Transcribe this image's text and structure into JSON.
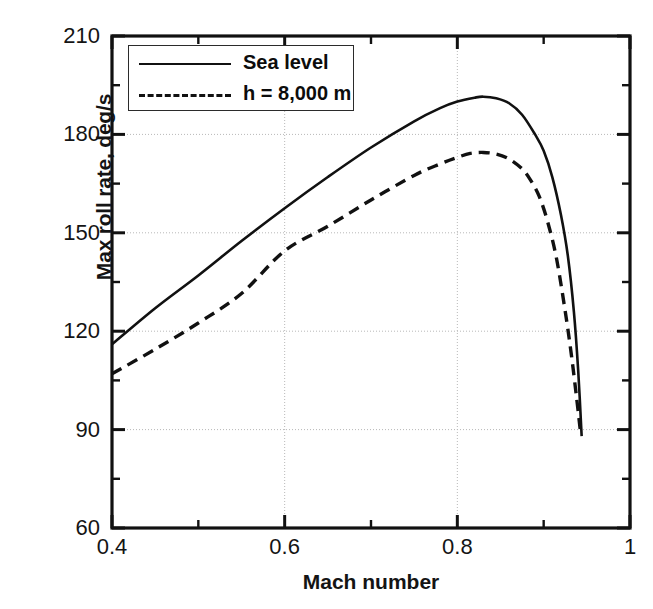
{
  "chart_data": {
    "type": "line",
    "title": "",
    "xlabel": "Mach number",
    "ylabel": "Max roll rate, deg/s",
    "xlim": [
      0.4,
      1.0
    ],
    "ylim": [
      60,
      210
    ],
    "xticks": [
      "0.4",
      "0.6",
      "0.8",
      "1"
    ],
    "xtick_values": [
      0.4,
      0.6,
      0.8,
      1.0
    ],
    "xminor_ticks": [
      0.5,
      0.7,
      0.9
    ],
    "yticks": [
      "60",
      "90",
      "120",
      "150",
      "180",
      "210"
    ],
    "ytick_values": [
      60,
      90,
      120,
      150,
      180,
      210
    ],
    "yminor_ticks": [
      75,
      105,
      135,
      165,
      195
    ],
    "grid": true,
    "grid_style": "dotted",
    "legend_position": "upper-left",
    "line_color": "#111111",
    "series": [
      {
        "name": "Sea level",
        "style": "solid",
        "x": [
          0.4,
          0.45,
          0.5,
          0.55,
          0.6,
          0.65,
          0.7,
          0.75,
          0.78,
          0.8,
          0.82,
          0.83,
          0.845,
          0.86,
          0.875,
          0.89,
          0.9,
          0.91,
          0.92,
          0.928,
          0.935,
          0.94,
          0.944
        ],
        "y": [
          116.0,
          127.0,
          137.0,
          147.5,
          157.5,
          167.0,
          176.0,
          184.0,
          188.0,
          190.0,
          191.2,
          191.5,
          191.0,
          189.5,
          186.0,
          180.0,
          175.0,
          167.0,
          155.5,
          143.0,
          126.0,
          108.0,
          88.0
        ]
      },
      {
        "name": "h = 8,000 m",
        "style": "dashed",
        "x": [
          0.4,
          0.45,
          0.5,
          0.55,
          0.6,
          0.65,
          0.7,
          0.75,
          0.78,
          0.8,
          0.815,
          0.83,
          0.845,
          0.86,
          0.875,
          0.885,
          0.895,
          0.905,
          0.915,
          0.925,
          0.932,
          0.938,
          0.943
        ],
        "y": [
          107.0,
          114.5,
          122.5,
          131.5,
          144.5,
          152.0,
          160.0,
          167.5,
          171.0,
          173.0,
          174.2,
          174.5,
          174.0,
          172.5,
          169.5,
          166.0,
          161.0,
          153.0,
          142.0,
          126.0,
          113.0,
          100.0,
          88.5
        ]
      }
    ],
    "legend": [
      {
        "label": "Sea level",
        "style": "solid"
      },
      {
        "label": "h = 8,000 m",
        "style": "dashed"
      }
    ]
  }
}
